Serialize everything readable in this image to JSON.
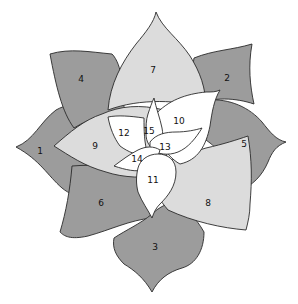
{
  "diagram": {
    "title": "",
    "tiers": {
      "outer": {
        "fill": "#9c9c9c"
      },
      "middle": {
        "fill": "#dcdcdc"
      },
      "inner": {
        "fill": "#ffffff"
      }
    },
    "petals": [
      {
        "id": "1",
        "label": "1",
        "tier": "outer"
      },
      {
        "id": "2",
        "label": "2",
        "tier": "outer"
      },
      {
        "id": "3",
        "label": "3",
        "tier": "outer"
      },
      {
        "id": "4",
        "label": "4",
        "tier": "outer"
      },
      {
        "id": "5",
        "label": "5",
        "tier": "outer"
      },
      {
        "id": "6",
        "label": "6",
        "tier": "outer"
      },
      {
        "id": "7",
        "label": "7",
        "tier": "middle"
      },
      {
        "id": "8",
        "label": "8",
        "tier": "middle"
      },
      {
        "id": "9",
        "label": "9",
        "tier": "middle"
      },
      {
        "id": "10",
        "label": "10",
        "tier": "inner"
      },
      {
        "id": "11",
        "label": "11",
        "tier": "inner"
      },
      {
        "id": "12",
        "label": "12",
        "tier": "inner"
      },
      {
        "id": "13",
        "label": "13",
        "tier": "inner"
      },
      {
        "id": "14",
        "label": "14",
        "tier": "inner"
      },
      {
        "id": "15",
        "label": "15",
        "tier": "inner"
      }
    ]
  }
}
